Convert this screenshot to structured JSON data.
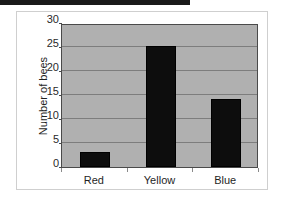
{
  "banner": {
    "name": "top-black-bar",
    "color": "#1a1a1a"
  },
  "frame": {
    "border_color": "#cfcfcf",
    "background": "#ffffff"
  },
  "chart_data": {
    "type": "bar",
    "title": "",
    "subtitle": "",
    "xlabel": "",
    "ylabel": "Number of bees",
    "categories": [
      "Red",
      "Yellow",
      "Blue"
    ],
    "values": [
      3.1,
      25.2,
      14.2
    ],
    "series": [
      {
        "name": "Number of bees",
        "values": [
          3.1,
          25.2,
          14.2
        ]
      }
    ],
    "ylim": [
      0,
      30
    ],
    "yticks": [
      0,
      5,
      10,
      15,
      20,
      25,
      30
    ],
    "ytick_labels": [
      "0",
      "5",
      "10",
      "15",
      "20",
      "25",
      "30"
    ],
    "grid": true,
    "grid_axis": "y",
    "legend": false,
    "legend_position": "none",
    "bar_color": "#0d0d0d",
    "plot_background": "#b0b0b0",
    "gridline_color": "#7d7d7d",
    "axis_color": "#4a4a4a",
    "annotations": []
  }
}
